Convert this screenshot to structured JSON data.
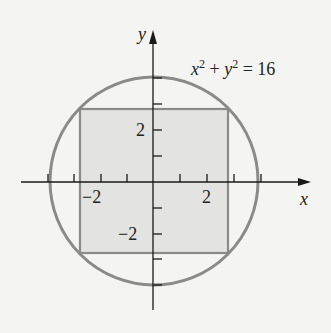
{
  "diagram": {
    "type": "region-diagram",
    "equation": {
      "x": "x",
      "exp1": "2",
      "plus": " + ",
      "y": "y",
      "exp2": "2",
      "rest": " = 16"
    },
    "axes": {
      "x_label": "x",
      "y_label": "y",
      "x_tick_labels": [
        "−2",
        "2"
      ],
      "y_tick_labels": [
        "2",
        "−2"
      ],
      "ticks": [
        -4,
        -3,
        -2,
        -1,
        1,
        2,
        3,
        4
      ]
    },
    "circle": {
      "radius": 4,
      "center": [
        0,
        0
      ]
    },
    "square": {
      "half_side": 2.83,
      "fill": "#e3e3e1"
    },
    "colors": {
      "background": "#f4f4f2",
      "circle_stroke": "#8a8a8a",
      "square_stroke": "#8a8a8a",
      "square_fill": "#e3e3e1",
      "axis": "#1a1a1a"
    }
  }
}
